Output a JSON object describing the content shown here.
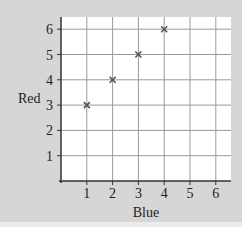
{
  "chart_data": {
    "type": "scatter",
    "title": "",
    "xlabel": "Blue",
    "ylabel": "Red",
    "x": [
      1,
      2,
      3,
      4
    ],
    "y": [
      3,
      4,
      5,
      6
    ],
    "series": [
      {
        "name": "points",
        "marker": "x",
        "x": [
          1,
          2,
          3,
          4
        ],
        "y": [
          3,
          4,
          5,
          6
        ]
      }
    ],
    "xticks": [
      1,
      2,
      3,
      4,
      5,
      6
    ],
    "yticks": [
      1,
      2,
      3,
      4,
      5,
      6
    ],
    "xlim": [
      0,
      6.6
    ],
    "ylim": [
      0,
      6.5
    ],
    "grid": true,
    "legend": null
  },
  "colors": {
    "background": "#d6d6d6",
    "plot_area": "#ffffff",
    "grid": "#9a9a9a",
    "axis": "#333333",
    "marker": "#555555"
  }
}
